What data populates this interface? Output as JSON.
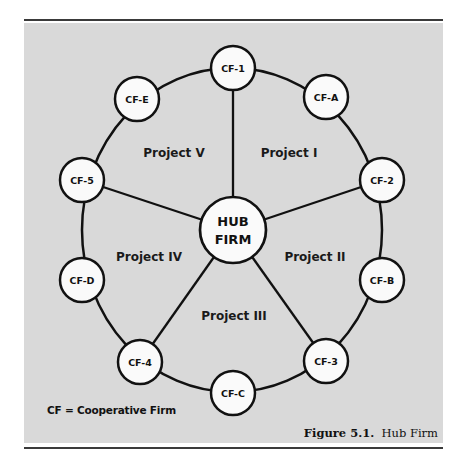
{
  "figure": {
    "caption_number": "Figure 5.1.",
    "caption_title": "Hub Firm",
    "legend": "CF = Cooperative Firm",
    "background_color": "#d9d9d9"
  },
  "hub": {
    "line1": "HUB",
    "line2": "FIRM"
  },
  "nodes": [
    {
      "id": "CF-1",
      "label": "CF-1"
    },
    {
      "id": "CF-A",
      "label": "CF-A"
    },
    {
      "id": "CF-2",
      "label": "CF-2"
    },
    {
      "id": "CF-B",
      "label": "CF-B"
    },
    {
      "id": "CF-3",
      "label": "CF-3"
    },
    {
      "id": "CF-C",
      "label": "CF-C"
    },
    {
      "id": "CF-4",
      "label": "CF-4"
    },
    {
      "id": "CF-D",
      "label": "CF-D"
    },
    {
      "id": "CF-5",
      "label": "CF-5"
    },
    {
      "id": "CF-E",
      "label": "CF-E"
    }
  ],
  "projects": [
    {
      "label": "Project I"
    },
    {
      "label": "Project II"
    },
    {
      "label": "Project III"
    },
    {
      "label": "Project IV"
    },
    {
      "label": "Project V"
    }
  ],
  "spokes": [
    "CF-1",
    "CF-2",
    "CF-3",
    "CF-4",
    "CF-5"
  ]
}
